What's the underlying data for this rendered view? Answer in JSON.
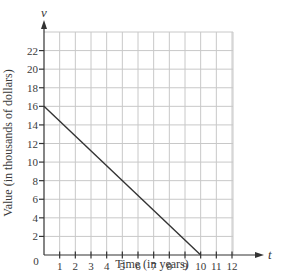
{
  "chart_data": {
    "type": "line",
    "title": "",
    "xlabel": "Time (in years)",
    "ylabel": "Value (in thousands of dollars)",
    "x_axis_variable": "t",
    "y_axis_variable": "v",
    "origin_label": "0",
    "xlim": [
      0,
      12
    ],
    "ylim": [
      0,
      24
    ],
    "x_ticks": [
      1,
      2,
      3,
      4,
      5,
      6,
      7,
      8,
      9,
      10,
      11,
      12
    ],
    "y_ticks": [
      2,
      4,
      6,
      8,
      10,
      12,
      14,
      16,
      18,
      20,
      22
    ],
    "grid": true,
    "legend": null,
    "series": [
      {
        "name": "value",
        "points": [
          {
            "x": 0,
            "y": 16
          },
          {
            "x": 10,
            "y": 0
          }
        ]
      }
    ],
    "colors": {
      "grid": "#c8c8c8",
      "axis": "#333333",
      "line": "#333333",
      "text": "#3a3a3a"
    }
  }
}
